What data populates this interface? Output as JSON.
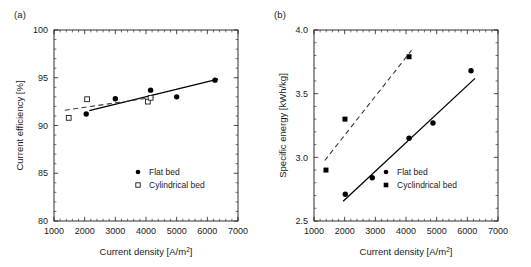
{
  "figure": {
    "background": "#ffffff",
    "foreground": "#1a1a1a"
  },
  "panels": [
    {
      "id": "a",
      "label": "(a)"
    },
    {
      "id": "b",
      "label": "(b)"
    }
  ],
  "chart_data": [
    {
      "type": "scatter",
      "panel": "(a)",
      "title": "",
      "xlabel": "Current density [A/m2]",
      "xlabel_base": "Current density [A/m",
      "xlabel_sup": "2",
      "xlabel_tail": "]",
      "ylabel": "Current efficiency [%]",
      "xlim": [
        1000,
        7000
      ],
      "ylim": [
        80,
        100
      ],
      "xticks": [
        1000,
        2000,
        3000,
        4000,
        5000,
        6000,
        7000
      ],
      "xtick_labels": [
        "1000",
        "2000",
        "3000",
        "4000",
        "5000",
        "6000",
        "7000"
      ],
      "yticks": [
        80,
        85,
        90,
        95,
        100
      ],
      "ytick_labels": [
        "80",
        "85",
        "90",
        "95",
        "100"
      ],
      "minor_x_per_interval": 5,
      "minor_y_per_interval": 5,
      "grid": false,
      "legend_position": "lower-right",
      "series": [
        {
          "name": "Flat bed",
          "marker": "filled-circle",
          "x": [
            2050,
            3000,
            4150,
            5000,
            6250
          ],
          "y": [
            91.2,
            92.8,
            93.7,
            93.0,
            94.75
          ],
          "trend": {
            "style": "solid",
            "x": [
              2150,
              6350
            ],
            "y": [
              91.55,
              94.85
            ]
          }
        },
        {
          "name": "Cylindrical bed",
          "marker": "open-square",
          "x": [
            1480,
            2080,
            4060,
            4150
          ],
          "y": [
            90.8,
            92.75,
            92.5,
            92.9
          ],
          "trend": {
            "style": "dashed",
            "x": [
              1350,
              4250
            ],
            "y": [
              91.6,
              92.95
            ]
          }
        }
      ]
    },
    {
      "type": "scatter",
      "panel": "(b)",
      "title": "",
      "xlabel": "Current density [A/m2]",
      "xlabel_base": "Current density [A/m",
      "xlabel_sup": "2",
      "xlabel_tail": "]",
      "ylabel": "Specific energy [kWh/kg]",
      "xlim": [
        1000,
        7000
      ],
      "ylim": [
        2.5,
        4.0
      ],
      "xticks": [
        1000,
        2000,
        3000,
        4000,
        5000,
        6000,
        7000
      ],
      "xtick_labels": [
        "1000",
        "2000",
        "3000",
        "4000",
        "5000",
        "6000",
        "7000"
      ],
      "yticks": [
        2.5,
        3.0,
        3.5,
        4.0
      ],
      "ytick_labels": [
        "2.5",
        "3.0",
        "3.5",
        "4.0"
      ],
      "minor_x_per_interval": 5,
      "minor_y_per_interval": 5,
      "grid": false,
      "legend_position": "lower-right",
      "series": [
        {
          "name": "Flat bed",
          "marker": "filled-circle",
          "x": [
            2020,
            2900,
            4100,
            4880,
            6120
          ],
          "y": [
            2.71,
            2.84,
            3.15,
            3.27,
            3.68
          ],
          "trend": {
            "style": "solid",
            "x": [
              1950,
              6250
            ],
            "y": [
              2.655,
              3.62
            ]
          }
        },
        {
          "name": "Cyclindrical bed",
          "marker": "filled-square",
          "x": [
            1390,
            2010,
            4100
          ],
          "y": [
            2.9,
            3.3,
            3.79
          ],
          "trend": {
            "style": "dashed",
            "x": [
              1350,
              4180
            ],
            "y": [
              2.975,
              3.84
            ]
          }
        }
      ]
    }
  ],
  "legends": [
    {
      "panel": "(a)",
      "entries": [
        {
          "label": "Flat bed",
          "marker": "filled-circle"
        },
        {
          "label": "Cylindrical bed",
          "marker": "open-square"
        }
      ]
    },
    {
      "panel": "(b)",
      "entries": [
        {
          "label": "Flat bed",
          "marker": "filled-circle"
        },
        {
          "label": "Cyclindrical bed",
          "marker": "filled-square"
        }
      ]
    }
  ]
}
